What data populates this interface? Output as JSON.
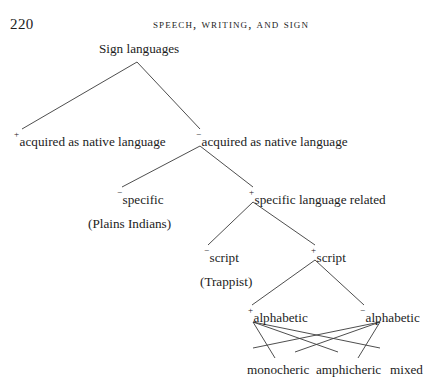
{
  "page": {
    "folio": "220",
    "running_head": "Speech, Writing, and Sign"
  },
  "tree": {
    "root": {
      "label": "Sign languages"
    },
    "nodes": [
      {
        "id": "acquired-plus",
        "sign": "+",
        "label": "acquired as native language"
      },
      {
        "id": "acquired-minus",
        "sign": "−",
        "label": "acquired as native language"
      },
      {
        "id": "specific-minus",
        "sign": "−",
        "label": "specific"
      },
      {
        "id": "specific-plus",
        "sign": "+",
        "label": "specific language related"
      },
      {
        "id": "script-minus",
        "sign": "−",
        "label": "script"
      },
      {
        "id": "script-plus",
        "sign": "+",
        "label": "script"
      },
      {
        "id": "alphabetic-plus",
        "sign": "+",
        "label": "alphabetic"
      },
      {
        "id": "alphabetic-minus",
        "sign": "−",
        "label": "alphabetic"
      }
    ],
    "glosses": [
      {
        "id": "plains-indians",
        "label": "(Plains Indians)"
      },
      {
        "id": "trappist",
        "label": "(Trappist)"
      }
    ],
    "terminals": [
      {
        "id": "monocheric",
        "label": "monocheric"
      },
      {
        "id": "amphicheric",
        "label": "amphicheric"
      },
      {
        "id": "mixed",
        "label": "mixed"
      }
    ]
  },
  "colors": {
    "ink": "#1c1c1c",
    "rule": "#3a3a3a",
    "paper": "#ffffff"
  }
}
